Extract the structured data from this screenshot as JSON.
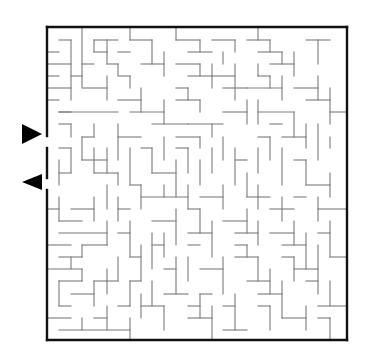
{
  "puzzle": {
    "title": "Maze",
    "type": "rectangular maze",
    "colors": {
      "background": "#ffffff",
      "walls": "#7a7a7a",
      "border": "#111111",
      "arrows": "#000000"
    },
    "bounds": {
      "x1": 47,
      "y1": 27,
      "x2": 347,
      "y2": 340
    },
    "cell_size_px": 12,
    "entrance": {
      "label": "entrance-arrow",
      "direction": "right",
      "opening_y": [
        136,
        148
      ],
      "arrow": [
        [
          22,
          124
        ],
        [
          42,
          134
        ],
        [
          22,
          144
        ]
      ]
    },
    "exit": {
      "label": "exit-arrow",
      "direction": "left",
      "opening_y": [
        178,
        190
      ],
      "arrow": [
        [
          42,
          174
        ],
        [
          22,
          182
        ],
        [
          42,
          190
        ]
      ]
    },
    "border_segments": [
      [
        47,
        27,
        347,
        27
      ],
      [
        347,
        27,
        347,
        340
      ],
      [
        347,
        340,
        47,
        340
      ],
      [
        47,
        340,
        47,
        190
      ],
      [
        47,
        178,
        47,
        148
      ],
      [
        47,
        136,
        47,
        27
      ]
    ],
    "walls": [
      [
        82,
        27,
        82,
        87
      ],
      [
        47,
        52,
        59,
        52
      ],
      [
        59,
        40,
        71,
        40
      ],
      [
        71,
        40,
        71,
        100
      ],
      [
        47,
        64,
        71,
        64
      ],
      [
        47,
        76,
        59,
        76
      ],
      [
        47,
        88,
        71,
        88
      ],
      [
        47,
        100,
        59,
        100
      ],
      [
        59,
        112,
        71,
        112
      ],
      [
        71,
        76,
        82,
        76
      ],
      [
        82,
        64,
        94,
        64
      ],
      [
        94,
        40,
        118,
        40
      ],
      [
        94,
        40,
        94,
        52
      ],
      [
        94,
        52,
        107,
        52
      ],
      [
        107,
        52,
        107,
        64
      ],
      [
        107,
        64,
        118,
        64
      ],
      [
        118,
        64,
        118,
        75
      ],
      [
        107,
        40,
        107,
        52
      ],
      [
        118,
        52,
        130,
        52
      ],
      [
        130,
        27,
        130,
        40
      ],
      [
        130,
        40,
        152,
        40
      ],
      [
        152,
        40,
        152,
        64
      ],
      [
        141,
        64,
        164,
        64
      ],
      [
        164,
        52,
        164,
        76
      ],
      [
        118,
        76,
        130,
        76
      ],
      [
        130,
        76,
        130,
        88
      ],
      [
        82,
        88,
        107,
        88
      ],
      [
        107,
        76,
        107,
        100
      ],
      [
        59,
        112,
        118,
        112
      ],
      [
        118,
        100,
        141,
        100
      ],
      [
        141,
        88,
        141,
        112
      ],
      [
        130,
        112,
        164,
        112
      ],
      [
        164,
        100,
        164,
        124
      ],
      [
        152,
        124,
        188,
        124
      ],
      [
        59,
        124,
        71,
        124
      ],
      [
        71,
        124,
        71,
        137
      ],
      [
        94,
        124,
        94,
        137
      ],
      [
        82,
        137,
        94,
        137
      ],
      [
        82,
        137,
        82,
        160
      ],
      [
        82,
        160,
        107,
        160
      ],
      [
        107,
        148,
        107,
        173
      ],
      [
        94,
        148,
        94,
        173
      ],
      [
        118,
        124,
        118,
        160
      ],
      [
        118,
        137,
        141,
        137
      ],
      [
        130,
        148,
        130,
        185
      ],
      [
        141,
        148,
        152,
        148
      ],
      [
        152,
        148,
        152,
        173
      ],
      [
        152,
        173,
        176,
        173
      ],
      [
        164,
        137,
        164,
        160
      ],
      [
        176,
        27,
        176,
        40
      ],
      [
        176,
        40,
        200,
        40
      ],
      [
        200,
        40,
        200,
        52
      ],
      [
        188,
        52,
        212,
        52
      ],
      [
        212,
        40,
        235,
        40
      ],
      [
        235,
        40,
        235,
        52
      ],
      [
        223,
        52,
        223,
        64
      ],
      [
        176,
        64,
        200,
        64
      ],
      [
        200,
        64,
        200,
        76
      ],
      [
        188,
        76,
        212,
        76
      ],
      [
        212,
        64,
        212,
        88
      ],
      [
        212,
        76,
        235,
        76
      ],
      [
        235,
        64,
        235,
        100
      ],
      [
        223,
        88,
        247,
        88
      ],
      [
        176,
        88,
        188,
        88
      ],
      [
        188,
        88,
        188,
        100
      ],
      [
        176,
        100,
        200,
        100
      ],
      [
        200,
        100,
        200,
        112
      ],
      [
        223,
        112,
        247,
        112
      ],
      [
        247,
        100,
        247,
        124
      ],
      [
        188,
        124,
        223,
        124
      ],
      [
        212,
        124,
        212,
        137
      ],
      [
        176,
        137,
        200,
        137
      ],
      [
        200,
        137,
        200,
        148
      ],
      [
        258,
        27,
        258,
        40
      ],
      [
        247,
        40,
        270,
        40
      ],
      [
        270,
        40,
        270,
        52
      ],
      [
        258,
        52,
        282,
        52
      ],
      [
        282,
        52,
        282,
        64
      ],
      [
        270,
        64,
        294,
        64
      ],
      [
        294,
        52,
        294,
        76
      ],
      [
        306,
        40,
        330,
        40
      ],
      [
        318,
        40,
        318,
        64
      ],
      [
        258,
        64,
        258,
        76
      ],
      [
        258,
        76,
        270,
        76
      ],
      [
        270,
        76,
        270,
        88
      ],
      [
        247,
        88,
        282,
        88
      ],
      [
        282,
        76,
        282,
        100
      ],
      [
        294,
        88,
        318,
        88
      ],
      [
        318,
        76,
        318,
        100
      ],
      [
        306,
        100,
        330,
        100
      ],
      [
        330,
        88,
        330,
        124
      ],
      [
        330,
        112,
        347,
        112
      ],
      [
        258,
        100,
        258,
        124
      ],
      [
        258,
        112,
        294,
        112
      ],
      [
        294,
        112,
        294,
        137
      ],
      [
        270,
        124,
        282,
        124
      ],
      [
        282,
        137,
        306,
        137
      ],
      [
        306,
        124,
        306,
        148
      ],
      [
        318,
        124,
        318,
        160
      ],
      [
        330,
        137,
        330,
        148
      ],
      [
        258,
        137,
        270,
        137
      ],
      [
        270,
        137,
        270,
        160
      ],
      [
        258,
        148,
        258,
        173
      ],
      [
        282,
        148,
        282,
        185
      ],
      [
        294,
        160,
        306,
        160
      ],
      [
        306,
        160,
        306,
        185
      ],
      [
        306,
        185,
        330,
        185
      ],
      [
        330,
        173,
        330,
        197
      ],
      [
        176,
        148,
        188,
        148
      ],
      [
        188,
        148,
        188,
        173
      ],
      [
        176,
        160,
        176,
        197
      ],
      [
        200,
        160,
        200,
        185
      ],
      [
        212,
        148,
        212,
        173
      ],
      [
        223,
        137,
        223,
        160
      ],
      [
        235,
        148,
        235,
        185
      ],
      [
        235,
        160,
        247,
        160
      ],
      [
        130,
        185,
        141,
        185
      ],
      [
        141,
        185,
        141,
        209
      ],
      [
        141,
        197,
        188,
        197
      ],
      [
        188,
        185,
        188,
        209
      ],
      [
        164,
        185,
        164,
        197
      ],
      [
        200,
        197,
        223,
        197
      ],
      [
        223,
        185,
        223,
        209
      ],
      [
        247,
        173,
        247,
        197
      ],
      [
        247,
        197,
        270,
        197
      ],
      [
        258,
        185,
        258,
        209
      ],
      [
        270,
        209,
        294,
        209
      ],
      [
        282,
        197,
        282,
        221
      ],
      [
        294,
        197,
        306,
        197
      ],
      [
        318,
        197,
        318,
        221
      ],
      [
        318,
        209,
        347,
        209
      ],
      [
        47,
        209,
        59,
        209
      ],
      [
        59,
        197,
        59,
        221
      ],
      [
        59,
        221,
        82,
        221
      ],
      [
        71,
        209,
        94,
        209
      ],
      [
        94,
        197,
        94,
        221
      ],
      [
        107,
        185,
        107,
        209
      ],
      [
        118,
        197,
        118,
        221
      ],
      [
        118,
        209,
        130,
        209
      ],
      [
        59,
        233,
        107,
        233
      ],
      [
        107,
        221,
        107,
        245
      ],
      [
        82,
        245,
        107,
        245
      ],
      [
        82,
        245,
        82,
        257
      ],
      [
        47,
        245,
        71,
        245
      ],
      [
        59,
        257,
        82,
        257
      ],
      [
        71,
        257,
        71,
        269
      ],
      [
        118,
        233,
        130,
        233
      ],
      [
        130,
        221,
        130,
        257
      ],
      [
        47,
        269,
        82,
        269
      ],
      [
        82,
        269,
        82,
        281
      ],
      [
        59,
        281,
        82,
        281
      ],
      [
        59,
        281,
        59,
        306
      ],
      [
        59,
        306,
        71,
        306
      ],
      [
        71,
        294,
        94,
        294
      ],
      [
        94,
        281,
        94,
        306
      ],
      [
        94,
        281,
        107,
        281
      ],
      [
        107,
        269,
        107,
        294
      ],
      [
        118,
        257,
        118,
        281
      ],
      [
        107,
        281,
        118,
        281
      ],
      [
        130,
        257,
        141,
        257
      ],
      [
        141,
        245,
        141,
        281
      ],
      [
        130,
        281,
        141,
        281
      ],
      [
        130,
        281,
        130,
        306
      ],
      [
        118,
        306,
        130,
        306
      ],
      [
        94,
        318,
        107,
        318
      ],
      [
        107,
        306,
        107,
        330
      ],
      [
        47,
        318,
        71,
        318
      ],
      [
        59,
        330,
        130,
        330
      ],
      [
        130,
        318,
        130,
        340
      ],
      [
        82,
        318,
        82,
        330
      ],
      [
        141,
        294,
        141,
        318
      ],
      [
        152,
        233,
        152,
        269
      ],
      [
        152,
        245,
        164,
        245
      ],
      [
        164,
        233,
        164,
        257
      ],
      [
        152,
        221,
        176,
        221
      ],
      [
        176,
        209,
        176,
        245
      ],
      [
        164,
        269,
        176,
        269
      ],
      [
        176,
        257,
        176,
        294
      ],
      [
        164,
        294,
        188,
        294
      ],
      [
        152,
        281,
        152,
        306
      ],
      [
        141,
        306,
        164,
        306
      ],
      [
        164,
        306,
        164,
        330
      ],
      [
        188,
        209,
        200,
        209
      ],
      [
        200,
        209,
        200,
        233
      ],
      [
        188,
        233,
        212,
        233
      ],
      [
        212,
        221,
        212,
        257
      ],
      [
        188,
        245,
        200,
        245
      ],
      [
        188,
        257,
        188,
        281
      ],
      [
        200,
        269,
        223,
        269
      ],
      [
        223,
        257,
        223,
        294
      ],
      [
        200,
        294,
        212,
        294
      ],
      [
        200,
        294,
        200,
        318
      ],
      [
        188,
        306,
        200,
        306
      ],
      [
        188,
        318,
        212,
        318
      ],
      [
        212,
        306,
        212,
        340
      ],
      [
        223,
        306,
        235,
        306
      ],
      [
        235,
        294,
        235,
        330
      ],
      [
        223,
        330,
        247,
        330
      ],
      [
        223,
        221,
        247,
        221
      ],
      [
        247,
        209,
        247,
        233
      ],
      [
        235,
        233,
        258,
        233
      ],
      [
        258,
        221,
        258,
        245
      ],
      [
        235,
        245,
        247,
        245
      ],
      [
        247,
        245,
        247,
        257
      ],
      [
        235,
        257,
        258,
        257
      ],
      [
        258,
        257,
        258,
        281
      ],
      [
        247,
        281,
        270,
        281
      ],
      [
        270,
        269,
        270,
        294
      ],
      [
        258,
        294,
        282,
        294
      ],
      [
        282,
        281,
        282,
        318
      ],
      [
        258,
        306,
        270,
        306
      ],
      [
        270,
        306,
        270,
        330
      ],
      [
        282,
        318,
        306,
        318
      ],
      [
        306,
        306,
        306,
        330
      ],
      [
        270,
        233,
        294,
        233
      ],
      [
        294,
        221,
        294,
        245
      ],
      [
        282,
        245,
        306,
        245
      ],
      [
        306,
        233,
        306,
        269
      ],
      [
        282,
        257,
        294,
        257
      ],
      [
        294,
        257,
        294,
        281
      ],
      [
        294,
        269,
        318,
        269
      ],
      [
        318,
        245,
        318,
        294
      ],
      [
        318,
        233,
        330,
        233
      ],
      [
        330,
        221,
        330,
        257
      ],
      [
        330,
        257,
        347,
        257
      ],
      [
        306,
        281,
        318,
        281
      ],
      [
        318,
        306,
        347,
        306
      ],
      [
        330,
        281,
        330,
        306
      ],
      [
        318,
        318,
        330,
        318
      ],
      [
        330,
        318,
        330,
        340
      ],
      [
        94,
        173,
        118,
        173
      ],
      [
        118,
        173,
        118,
        185
      ],
      [
        59,
        148,
        71,
        148
      ],
      [
        71,
        148,
        71,
        173
      ],
      [
        59,
        173,
        71,
        173
      ],
      [
        59,
        160,
        59,
        185
      ]
    ]
  }
}
